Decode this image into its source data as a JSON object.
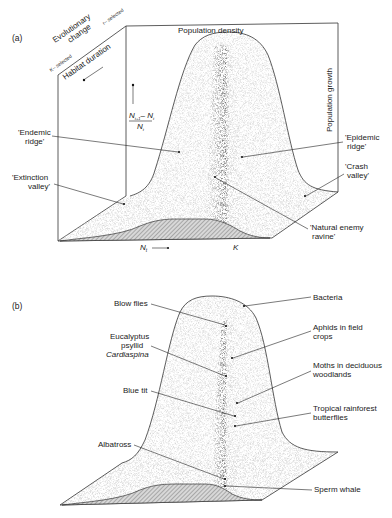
{
  "panel_a": {
    "label": "(a)",
    "axes": {
      "top": "Population density",
      "right": "Population growth",
      "bottom_left": "N",
      "bottom_left_sub": "t",
      "bottom_right": "K",
      "vertical_numerator": "N",
      "vertical_numerator_sub": "t+1",
      "vertical_minus": "– N",
      "vertical_minus_sub": "t",
      "vertical_denominator": "N",
      "vertical_denominator_sub": "t",
      "depth_title_1": "Evolutionary",
      "depth_title_2": "change",
      "depth_low": "K– selected",
      "depth_high": "r– selected",
      "depth_axis": "Habitat duration"
    },
    "annotations": [
      {
        "line1": "'Endemic",
        "line2": "ridge'"
      },
      {
        "line1": "'Extinction",
        "line2": "valley'"
      },
      {
        "line1": "'Epidemic",
        "line2": "ridge'"
      },
      {
        "line1": "'Crash",
        "line2": "valley'"
      },
      {
        "line1": "'Natural enemy",
        "line2": "ravine'"
      }
    ]
  },
  "panel_b": {
    "label": "(b)",
    "annotations": [
      {
        "line1": "Blow flies"
      },
      {
        "line1": "Eucalyptus",
        "line2": "psyllid",
        "line3": "Cardiaspina"
      },
      {
        "line1": "Blue tit"
      },
      {
        "line1": "Albatross"
      },
      {
        "line1": "Bacteria"
      },
      {
        "line1": "Aphids in field",
        "line2": "crops"
      },
      {
        "line1": "Moths in deciduous",
        "line2": "woodlands"
      },
      {
        "line1": "Tropical rainforest",
        "line2": "butterflies"
      },
      {
        "line1": "Sperm whale"
      }
    ]
  },
  "colors": {
    "ink": "#222222",
    "stipple": "#555555",
    "hatch": "#888888",
    "background": "#ffffff"
  }
}
